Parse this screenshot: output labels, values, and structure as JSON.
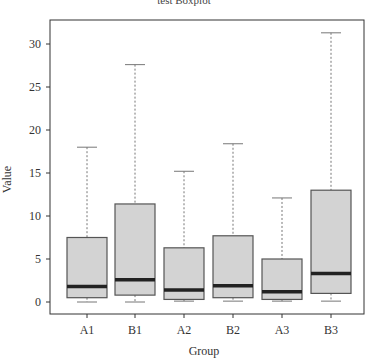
{
  "chart_data": {
    "type": "boxplot",
    "title": "test Boxplot",
    "xlabel": "Group",
    "ylabel": "Value",
    "ylim": [
      -1.4,
      32.7
    ],
    "yticks": [
      0,
      5,
      10,
      15,
      20,
      25,
      30
    ],
    "categories": [
      "A1",
      "B1",
      "A2",
      "B2",
      "A3",
      "B3"
    ],
    "boxes": [
      {
        "name": "A1",
        "whisker_low": 0.0,
        "q1": 0.5,
        "median": 1.8,
        "q3": 7.5,
        "whisker_high": 18.0
      },
      {
        "name": "B1",
        "whisker_low": 0.0,
        "q1": 0.8,
        "median": 2.6,
        "q3": 11.4,
        "whisker_high": 27.6
      },
      {
        "name": "A2",
        "whisker_low": 0.1,
        "q1": 0.3,
        "median": 1.4,
        "q3": 6.3,
        "whisker_high": 15.2
      },
      {
        "name": "B2",
        "whisker_low": 0.1,
        "q1": 0.5,
        "median": 1.9,
        "q3": 7.7,
        "whisker_high": 18.4
      },
      {
        "name": "A3",
        "whisker_low": 0.1,
        "q1": 0.3,
        "median": 1.2,
        "q3": 5.0,
        "whisker_high": 12.1
      },
      {
        "name": "B3",
        "whisker_low": 0.1,
        "q1": 1.0,
        "median": 3.3,
        "q3": 13.0,
        "whisker_high": 31.3
      }
    ],
    "colors": {
      "box_fill": "#d3d3d3",
      "box_stroke": "#555555",
      "median": "#222222",
      "whisker": "#777777"
    },
    "grid": false,
    "legend": null
  }
}
